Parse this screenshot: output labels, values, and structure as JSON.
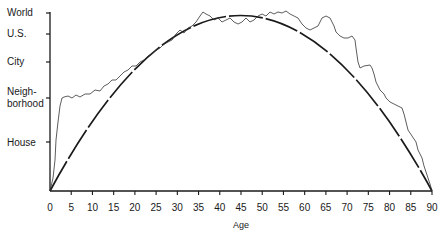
{
  "chart_data": {
    "type": "line",
    "title": "",
    "xlabel": "Age",
    "ylabel": "",
    "xlim": [
      0,
      90
    ],
    "x_ticks": [
      0,
      5,
      10,
      15,
      20,
      25,
      30,
      35,
      40,
      45,
      50,
      55,
      60,
      65,
      70,
      75,
      80,
      85,
      90
    ],
    "y_levels": [
      {
        "label": "House",
        "value": 1
      },
      {
        "label": "Neigh-\nborhood",
        "label_lines": [
          "Neigh-",
          "borhood"
        ],
        "value": 2
      },
      {
        "label": "City",
        "value": 3
      },
      {
        "label": "U.S.",
        "value": 4
      },
      {
        "label": "World",
        "value": 5
      }
    ],
    "grid": false,
    "legend": null,
    "series": [
      {
        "name": "idealized arc (dashed)",
        "style": "dashed",
        "x": [
          0,
          5,
          10,
          15,
          20,
          25,
          30,
          35,
          40,
          45,
          50,
          55,
          60,
          65,
          70,
          75,
          80,
          85,
          90
        ],
        "values": [
          0,
          1.1,
          2.0,
          2.8,
          3.4,
          3.9,
          4.3,
          4.6,
          4.8,
          4.85,
          4.8,
          4.6,
          4.3,
          3.9,
          3.4,
          2.8,
          2.0,
          1.1,
          0
        ]
      },
      {
        "name": "empirical trace (jagged)",
        "style": "solid-thin",
        "x": [
          0,
          1,
          2,
          3,
          5,
          10,
          15,
          20,
          25,
          28,
          30,
          35,
          40,
          45,
          50,
          55,
          57,
          60,
          62,
          65,
          70,
          75,
          80,
          85,
          88,
          90
        ],
        "values": [
          0,
          0.8,
          1.6,
          2.0,
          2.05,
          2.2,
          2.7,
          3.6,
          4.0,
          4.5,
          4.4,
          4.5,
          4.8,
          4.85,
          4.6,
          4.2,
          4.5,
          4.4,
          3.5,
          3.4,
          2.7,
          2.3,
          1.4,
          0.9,
          0.4,
          0
        ]
      }
    ]
  },
  "axis": {
    "x_tick_labels": [
      "0",
      "5",
      "10",
      "15",
      "20",
      "25",
      "30",
      "35",
      "40",
      "45",
      "50",
      "55",
      "60",
      "65",
      "70",
      "75",
      "80",
      "85",
      "90"
    ],
    "x_title": "Age",
    "y_labels": {
      "world": "World",
      "us": "U.S.",
      "city": "City",
      "neigh_1": "Neigh-",
      "neigh_2": "borhood",
      "house": "House"
    }
  },
  "paths": {
    "arc": "M50,191 Q240,-160 432,191",
    "jagged": "M50,191 L53,178 L55,160 L56,140 L58,122 L60,106 L62,98 L64,97 L68,96 L72,98 L76,95 L80,97 L85,94 L90,94 L95,90 L100,91 L104,86 L108,84 L112,80 L116,80 L120,76 L124,72 L128,70 L132,66 L136,66 L140,62 L144,60 L148,56 L152,54 L156,50 L160,48 L164,44 L168,42 L172,40 L176,34 L180,30 L184,33 L188,28 L192,26 L196,22 L200,16 L203,12 L206,14 L210,16 L214,20 L218,18 L222,22 L226,20 L230,18 L234,22 L238,24 L242,22 L246,18 L250,22 L254,20 L258,16 L262,14 L266,16 L270,12 L274,14 L278,12 L282,13 L286,11 L290,14 L294,16 L298,18 L302,24 L306,28 L310,30 L314,28 L318,26 L320,22 L322,18 L326,16 L330,18 L332,22 L334,26 L336,32 L340,36 L344,38 L348,38 L352,36 L355,40 L356,48 L358,62 L360,68 L364,66 L370,65 L372,68 L374,74 L376,82 L380,90 L384,94 L386,98 L390,102 L394,104 L398,106 L402,108 L404,114 L406,122 L408,130 L412,136 L416,142 L418,150 L422,158 L424,166 L426,172 L428,178 L430,184 L432,191"
  },
  "colors": {
    "ink": "#1a1a1a",
    "background": "#ffffff"
  }
}
